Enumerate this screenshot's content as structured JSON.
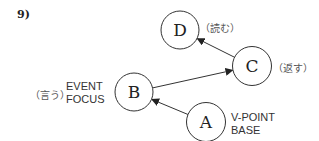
{
  "figure_number": "9)",
  "colors": {
    "stroke": "#333333",
    "text": "#222222",
    "annotation": "#555555"
  },
  "nodes": [
    {
      "id": "A",
      "label": "A",
      "gloss": "",
      "role": [
        "V-POINT",
        "BASE"
      ]
    },
    {
      "id": "B",
      "label": "B",
      "gloss": "（言う）",
      "role": [
        "EVENT",
        "FOCUS"
      ]
    },
    {
      "id": "C",
      "label": "C",
      "gloss": "（返す）",
      "role": []
    },
    {
      "id": "D",
      "label": "D",
      "gloss": "（読む）",
      "role": []
    }
  ],
  "edges": [
    {
      "from": "A",
      "to": "B"
    },
    {
      "from": "B",
      "to": "C"
    },
    {
      "from": "C",
      "to": "D"
    }
  ]
}
